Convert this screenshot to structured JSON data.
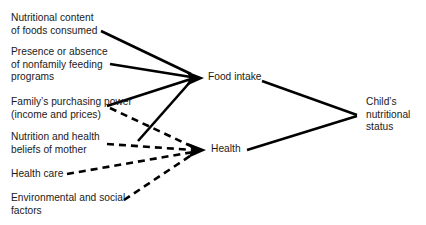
{
  "diagram": {
    "type": "flow-diagram",
    "canvas": {
      "width": 426,
      "height": 225,
      "background": "#ffffff"
    },
    "line_color": "#000000",
    "text_color": "#1a1a1a",
    "nodes": {
      "nutritional_content": "Nutritional content\nof foods consumed",
      "nonfamily_feeding": "Presence or absence\nof nonfamily feeding\nprograms",
      "purchasing_power": "Family’s purchasing power\n(income and prices)",
      "beliefs_of_mother": "Nutrition and health\nbeliefs of mother",
      "health_care": "Health care",
      "environmental": "Environmental and social\nfactors",
      "food_intake": "Food intake",
      "health": "Health",
      "child_status": "Child’s\nnutritional\nstatus"
    },
    "edges": [
      {
        "from": "nutritional_content",
        "to": "food_intake",
        "style": "solid",
        "arrow": true
      },
      {
        "from": "nonfamily_feeding",
        "to": "food_intake",
        "style": "solid",
        "arrow": true
      },
      {
        "from": "purchasing_power",
        "to": "food_intake",
        "style": "solid",
        "arrow": true
      },
      {
        "from": "beliefs_of_mother",
        "to": "food_intake",
        "style": "solid",
        "arrow": true
      },
      {
        "from": "purchasing_power",
        "to": "health",
        "style": "dashed",
        "arrow": true
      },
      {
        "from": "beliefs_of_mother",
        "to": "health",
        "style": "dashed",
        "arrow": true
      },
      {
        "from": "health_care",
        "to": "health",
        "style": "dashed",
        "arrow": true
      },
      {
        "from": "environmental",
        "to": "health",
        "style": "dashed",
        "arrow": true
      },
      {
        "from": "food_intake",
        "to": "child_status",
        "style": "solid",
        "arrow": false
      },
      {
        "from": "health",
        "to": "child_status",
        "style": "solid",
        "arrow": false
      }
    ]
  }
}
